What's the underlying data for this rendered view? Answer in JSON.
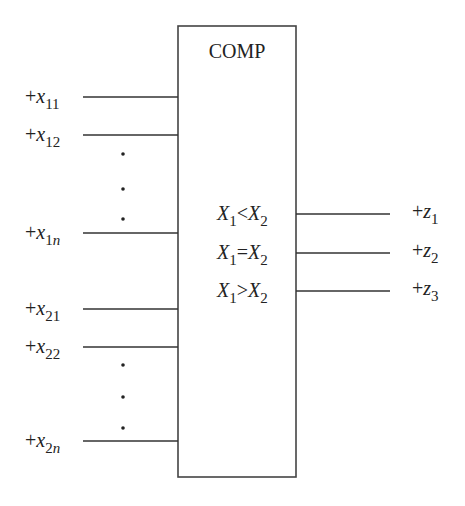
{
  "diagram": {
    "type": "logic-block-diagram",
    "block": {
      "title": "COMP",
      "x": 178,
      "y": 26,
      "width": 118,
      "height": 451,
      "stroke_color": "#444444"
    },
    "inputs": [
      {
        "prefix": "+",
        "var": "x",
        "sub": "11",
        "y": 97
      },
      {
        "prefix": "+",
        "var": "x",
        "sub": "12",
        "y": 135
      },
      {
        "prefix": "+",
        "var": "x",
        "sub": "1n",
        "sub_digit": "1",
        "sub_ital": "n",
        "y": 233
      },
      {
        "prefix": "+",
        "var": "x",
        "sub": "21",
        "y": 309
      },
      {
        "prefix": "+",
        "var": "x",
        "sub": "22",
        "y": 347
      },
      {
        "prefix": "+",
        "var": "x",
        "sub": "2n",
        "sub_digit": "2",
        "sub_ital": "n",
        "y": 441
      }
    ],
    "ellipsis_groups": [
      {
        "x": 123,
        "dots_y": [
          154,
          189,
          219
        ]
      },
      {
        "x": 123,
        "dots_y": [
          365,
          397,
          428
        ]
      }
    ],
    "conditions": [
      {
        "left_var": "X",
        "left_sub": "1",
        "op": "<",
        "right_var": "X",
        "right_sub": "2",
        "y": 214
      },
      {
        "left_var": "X",
        "left_sub": "1",
        "op": "=",
        "right_var": "X",
        "right_sub": "2",
        "y": 253
      },
      {
        "left_var": "X",
        "left_sub": "1",
        "op": ">",
        "right_var": "X",
        "right_sub": "2",
        "y": 291
      }
    ],
    "outputs": [
      {
        "prefix": "+",
        "var": "z",
        "sub": "1",
        "y": 214
      },
      {
        "prefix": "+",
        "var": "z",
        "sub": "2",
        "y": 253
      },
      {
        "prefix": "+",
        "var": "z",
        "sub": "3",
        "y": 291
      }
    ],
    "wire_color": "#333333",
    "text_color": "#222222"
  }
}
